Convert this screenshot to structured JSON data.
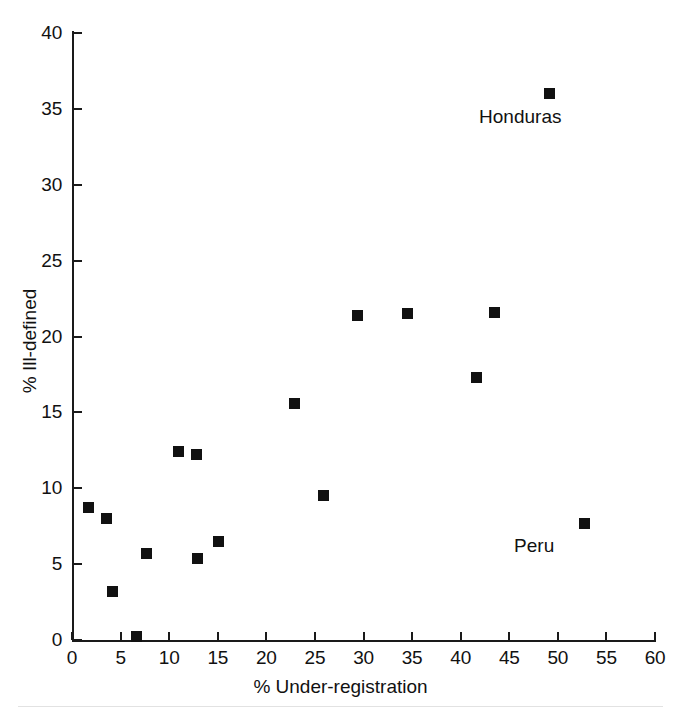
{
  "chart_data": {
    "type": "scatter",
    "title": "",
    "xlabel": "% Under-registration",
    "ylabel": "% Ill-defined",
    "xlim": [
      0,
      60
    ],
    "ylim": [
      0,
      40
    ],
    "xticks": [
      0,
      5,
      10,
      15,
      20,
      25,
      30,
      35,
      40,
      45,
      50,
      55,
      60
    ],
    "yticks": [
      0,
      5,
      10,
      15,
      20,
      25,
      30,
      35,
      40
    ],
    "xtick_labels": [
      "0",
      "5",
      "10",
      "15",
      "20",
      "25",
      "30",
      "35",
      "40",
      "45",
      "50",
      "55",
      "60"
    ],
    "ytick_labels": [
      "0",
      "5",
      "10",
      "15",
      "20",
      "25",
      "30",
      "35",
      "40"
    ],
    "grid": false,
    "legend": "none",
    "marker": "filled-square",
    "marker_color": "#111111",
    "points": [
      {
        "x": 1.7,
        "y": 8.7,
        "label": ""
      },
      {
        "x": 3.6,
        "y": 8.0,
        "label": ""
      },
      {
        "x": 4.2,
        "y": 3.2,
        "label": ""
      },
      {
        "x": 6.6,
        "y": 0.2,
        "label": ""
      },
      {
        "x": 7.7,
        "y": 5.7,
        "label": ""
      },
      {
        "x": 11.0,
        "y": 12.4,
        "label": ""
      },
      {
        "x": 12.8,
        "y": 12.2,
        "label": ""
      },
      {
        "x": 12.9,
        "y": 5.4,
        "label": ""
      },
      {
        "x": 15.1,
        "y": 6.5,
        "label": ""
      },
      {
        "x": 22.9,
        "y": 15.6,
        "label": ""
      },
      {
        "x": 25.9,
        "y": 9.5,
        "label": ""
      },
      {
        "x": 29.4,
        "y": 21.4,
        "label": ""
      },
      {
        "x": 34.5,
        "y": 21.5,
        "label": ""
      },
      {
        "x": 41.6,
        "y": 17.3,
        "label": ""
      },
      {
        "x": 43.5,
        "y": 21.6,
        "label": ""
      },
      {
        "x": 49.1,
        "y": 36.0,
        "label": "Honduras"
      },
      {
        "x": 52.7,
        "y": 7.7,
        "label": "Peru"
      }
    ],
    "annotations": [
      {
        "text": "Honduras",
        "x": 49.1,
        "y": 36.0,
        "position": "below-left"
      },
      {
        "text": "Peru",
        "x": 52.7,
        "y": 7.7,
        "position": "below-left"
      }
    ]
  }
}
